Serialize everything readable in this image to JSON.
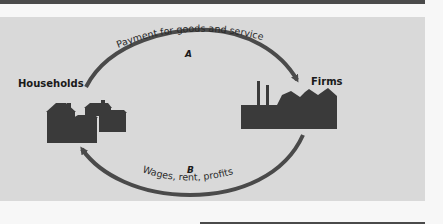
{
  "diagram": {
    "type": "circular-flow",
    "nodes": {
      "households": {
        "label": "Households"
      },
      "firms": {
        "label": "Firms"
      }
    },
    "flows": [
      {
        "id": "A",
        "letter": "A",
        "label": "Payment for goods and services",
        "from": "Households",
        "to": "Firms"
      },
      {
        "id": "B",
        "letter": "B",
        "label": "Wages, rent, profits",
        "from": "Firms",
        "to": "Households"
      }
    ],
    "colors": {
      "panel": "#d9d9d9",
      "arrow": "#4a4a4a",
      "icon": "#3a3a3a",
      "band": "#4a4a4a"
    }
  }
}
